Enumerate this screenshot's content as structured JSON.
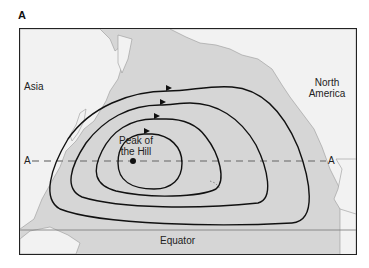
{
  "figure": {
    "panel_label": "A",
    "continents": {
      "asia": "Asia",
      "north_america_line1": "North",
      "north_america_line2": "America"
    },
    "peak": {
      "line1": "Peak of",
      "line2": "the Hill"
    },
    "section_line": {
      "left_label": "A",
      "right_label": "A"
    },
    "equator_label": "Equator",
    "contour_count": 4,
    "flow_direction": "clockwise",
    "colors": {
      "ocean": "#d6d6d6",
      "land": "#f2f2f2",
      "contour": "#111111",
      "section_dash": "#8a8a8a",
      "equator_line": "#777777"
    }
  }
}
